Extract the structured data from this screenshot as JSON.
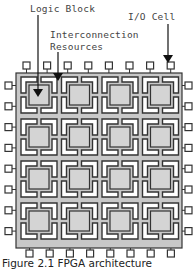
{
  "labels": {
    "logic_block": "Logic Block",
    "io_cell": "I/O Cell",
    "interconnect_line1": "Interconnection",
    "interconnect_line2": "Resources"
  },
  "caption": "Figure 2.1   FPGA architecture",
  "grid": {
    "rows": 4,
    "cols": 4
  },
  "io_cells": {
    "top": 8,
    "bottom": 8,
    "left": 8,
    "right": 8
  },
  "colors": {
    "die_fill": "#c8c8c8",
    "block_fill": "#d4d4d4",
    "bracket_fill": "#ffffff",
    "outline": "#333333"
  }
}
